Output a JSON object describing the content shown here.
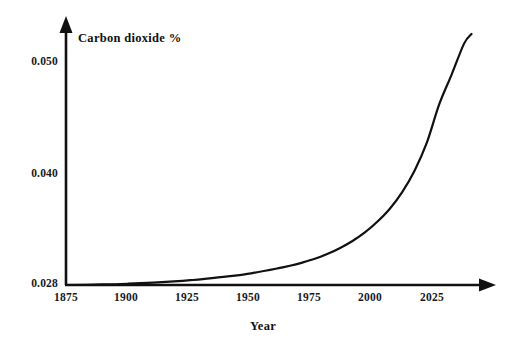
{
  "chart_data": {
    "type": "line",
    "title": "",
    "subtitle": "",
    "xlabel": "Year",
    "ylabel": "Carbon dioxide %",
    "ylabel_full": "Carbon dioxide %",
    "x_tick_labels": [
      "1875",
      "1900",
      "1925",
      "1950",
      "1975",
      "2000",
      "2025"
    ],
    "x_tick_values": [
      1875,
      1900,
      1925,
      1950,
      1975,
      2000,
      2025
    ],
    "y_tick_labels": [
      "0.028",
      "0.040",
      "0.050"
    ],
    "y_tick_values": [
      0.028,
      0.04,
      0.05
    ],
    "xlim": [
      1875,
      2040
    ],
    "ylim": [
      0.028,
      0.0515
    ],
    "grid": false,
    "legend": null,
    "legend_position": "none",
    "series": [
      {
        "name": "Atmospheric carbon dioxide concentration",
        "x": [
          1875,
          1890,
          1900,
          1910,
          1920,
          1925,
          1930,
          1940,
          1950,
          1960,
          1965,
          1970,
          1975,
          1980,
          1985,
          1990,
          1995,
          2000,
          2005,
          2010,
          2015,
          2020,
          2025,
          2030,
          2035,
          2038
        ],
        "values": [
          0.028,
          0.02805,
          0.02812,
          0.02822,
          0.02836,
          0.02845,
          0.02855,
          0.0288,
          0.02912,
          0.02955,
          0.0298,
          0.0301,
          0.03045,
          0.0309,
          0.03145,
          0.0321,
          0.0329,
          0.0339,
          0.0351,
          0.03665,
          0.03865,
          0.0413,
          0.0449,
          0.0477,
          0.0506,
          0.0515
        ]
      }
    ],
    "annotations": []
  },
  "axes": {
    "y_axis_name": "carbon-dioxide-percent-axis",
    "x_axis_name": "year-axis",
    "arrow_style": "open-arrowhead-both-axes",
    "line_color": "#111111",
    "background_color": "#ffffff"
  },
  "colors": {
    "curve": "#111111",
    "axis": "#111111",
    "background": "#ffffff",
    "text": "#1a1a1a"
  }
}
